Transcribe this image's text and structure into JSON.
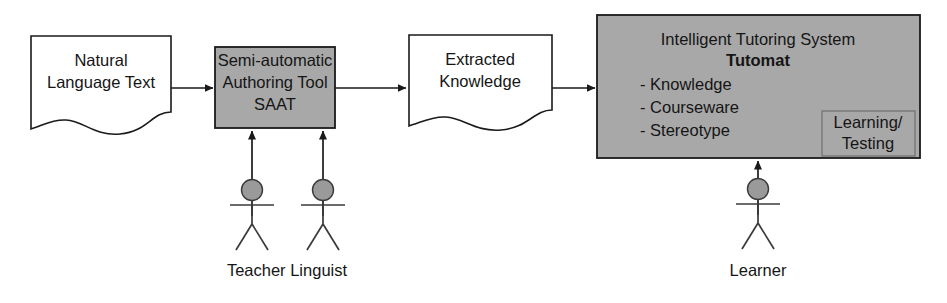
{
  "diagram": {
    "colors": {
      "process_fill": "#a8a8a8",
      "document_fill": "#ffffff",
      "stroke": "#1a1a1a",
      "actor_head_fill": "#9a9a9a",
      "background": "#ffffff"
    },
    "nodes": {
      "natural_language_text": {
        "type": "document",
        "line1": "Natural",
        "line2": "Language Text"
      },
      "saat": {
        "type": "process",
        "line1": "Semi-automatic",
        "line2": "Authoring Tool",
        "line3": "SAAT"
      },
      "extracted_knowledge": {
        "type": "document",
        "line1": "Extracted",
        "line2": "Knowledge"
      },
      "its": {
        "type": "process",
        "heading": "Intelligent Tutoring System",
        "subheading": "Tutomat",
        "bullets": [
          "- Knowledge",
          "- Courseware",
          "- Stereotype"
        ],
        "inner_box": {
          "line1": "Learning/",
          "line2": "Testing"
        }
      }
    },
    "actors": {
      "teacher": {
        "label": "Teacher"
      },
      "linguist": {
        "label": "Linguist"
      },
      "learner": {
        "label": "Learner"
      }
    },
    "actor_labels": {
      "teacher_linguist": "Teacher Linguist",
      "learner": "Learner"
    },
    "edges": [
      {
        "from": "natural_language_text",
        "to": "saat",
        "direction": "right"
      },
      {
        "from": "saat",
        "to": "extracted_knowledge",
        "direction": "right"
      },
      {
        "from": "extracted_knowledge",
        "to": "its",
        "direction": "right"
      },
      {
        "from": "teacher",
        "to": "saat",
        "direction": "up"
      },
      {
        "from": "linguist",
        "to": "saat",
        "direction": "up"
      },
      {
        "from": "learner",
        "to": "its",
        "direction": "up"
      }
    ]
  }
}
